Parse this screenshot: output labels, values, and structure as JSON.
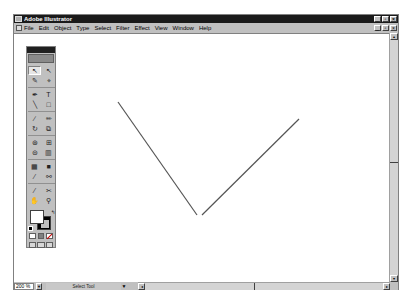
{
  "window": {
    "title": "Adobe Illustrator",
    "controls": [
      "_",
      "▫",
      "×"
    ]
  },
  "menubar": {
    "items": [
      {
        "label": "File"
      },
      {
        "label": "Edit"
      },
      {
        "label": "Object"
      },
      {
        "label": "Type"
      },
      {
        "label": "Select"
      },
      {
        "label": "Filter"
      },
      {
        "label": "Effect"
      },
      {
        "label": "View"
      },
      {
        "label": "Window"
      },
      {
        "label": "Help"
      }
    ],
    "doc_controls": [
      "_",
      "▫",
      "×"
    ]
  },
  "toolbox": {
    "tools": [
      {
        "name": "selection-tool",
        "glyph": "↖",
        "selected": true
      },
      {
        "name": "direct-selection-tool",
        "glyph": "↖"
      },
      {
        "name": "magic-wand-tool",
        "glyph": "✎"
      },
      {
        "name": "lasso-tool",
        "glyph": "⌖"
      },
      {
        "name": "pen-tool",
        "glyph": "✒"
      },
      {
        "name": "type-tool",
        "glyph": "T"
      },
      {
        "name": "line-segment-tool",
        "glyph": "╲"
      },
      {
        "name": "rectangle-tool",
        "glyph": "□"
      },
      {
        "name": "paintbrush-tool",
        "glyph": "∕"
      },
      {
        "name": "pencil-tool",
        "glyph": "✏"
      },
      {
        "name": "rotate-tool",
        "glyph": "↻"
      },
      {
        "name": "scale-tool",
        "glyph": "⧉"
      },
      {
        "name": "warp-tool",
        "glyph": "⊛"
      },
      {
        "name": "free-transform-tool",
        "glyph": "⊞"
      },
      {
        "name": "symbol-sprayer-tool",
        "glyph": "⊜"
      },
      {
        "name": "column-graph-tool",
        "glyph": "▥"
      },
      {
        "name": "mesh-tool",
        "glyph": "▦"
      },
      {
        "name": "gradient-tool",
        "glyph": "■"
      },
      {
        "name": "eyedropper-tool",
        "glyph": "⁄"
      },
      {
        "name": "blend-tool",
        "glyph": "⚯"
      },
      {
        "name": "slice-tool",
        "glyph": "⁄"
      },
      {
        "name": "scissors-tool",
        "glyph": "✂"
      },
      {
        "name": "hand-tool",
        "glyph": "✋"
      },
      {
        "name": "zoom-tool",
        "glyph": "⚲"
      }
    ],
    "fill_color": "#ffffff",
    "stroke_color": "#000000"
  },
  "canvas": {
    "paths": [
      {
        "x1": 104,
        "y1": 68,
        "x2": 183,
        "y2": 181
      },
      {
        "x1": 188,
        "y1": 181,
        "x2": 285,
        "y2": 85
      }
    ],
    "stroke_color": "#555555"
  },
  "statusbar": {
    "zoom_level": "200 %",
    "status_text": "Select Tool",
    "status_arrow": "▼",
    "scroll_left": "◂",
    "scroll_right": "▸"
  },
  "vscroll": {
    "up": "▴",
    "down": "▾"
  }
}
